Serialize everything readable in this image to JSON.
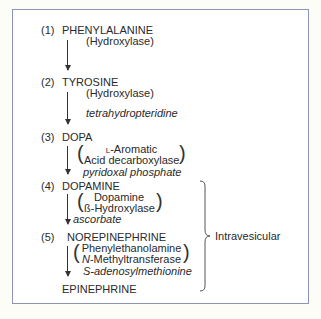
{
  "steps": [
    {
      "number": "(1)",
      "compound": "PHENYLALANINE",
      "enzyme": [
        "(Hydroxylase)"
      ],
      "cofactor": ""
    },
    {
      "number": "(2)",
      "compound": "TYROSINE",
      "enzyme": [
        "(Hydroxylase)"
      ],
      "cofactor": "tetrahydropteridine"
    },
    {
      "number": "(3)",
      "compound": "DOPA",
      "enzyme": [
        "L-Aromatic",
        "Acid decarboxylase"
      ],
      "cofactor": "pyridoxal phosphate"
    },
    {
      "number": "(4)",
      "compound": "DOPAMINE",
      "enzyme": [
        "Dopamine",
        "ß-Hydroxylase"
      ],
      "cofactor": "ascorbate"
    },
    {
      "number": "(5)",
      "compound": "NOREPINEPHRINE",
      "enzyme": [
        "Phenylethanolamine",
        "N-Methyltransferase"
      ],
      "cofactor": "S-adenosylmethionine"
    }
  ],
  "final": {
    "compound": "EPINEPHRINE"
  },
  "enzyme3_prefix": "L",
  "enzyme3_rest": "-Aromatic",
  "enzyme5_prefix": "N",
  "enzyme5_rest": "-Methyltransferase",
  "brace_label": "Intravesicular",
  "colors": {
    "border": "#8e93b8",
    "background": "#fdfdf8"
  }
}
